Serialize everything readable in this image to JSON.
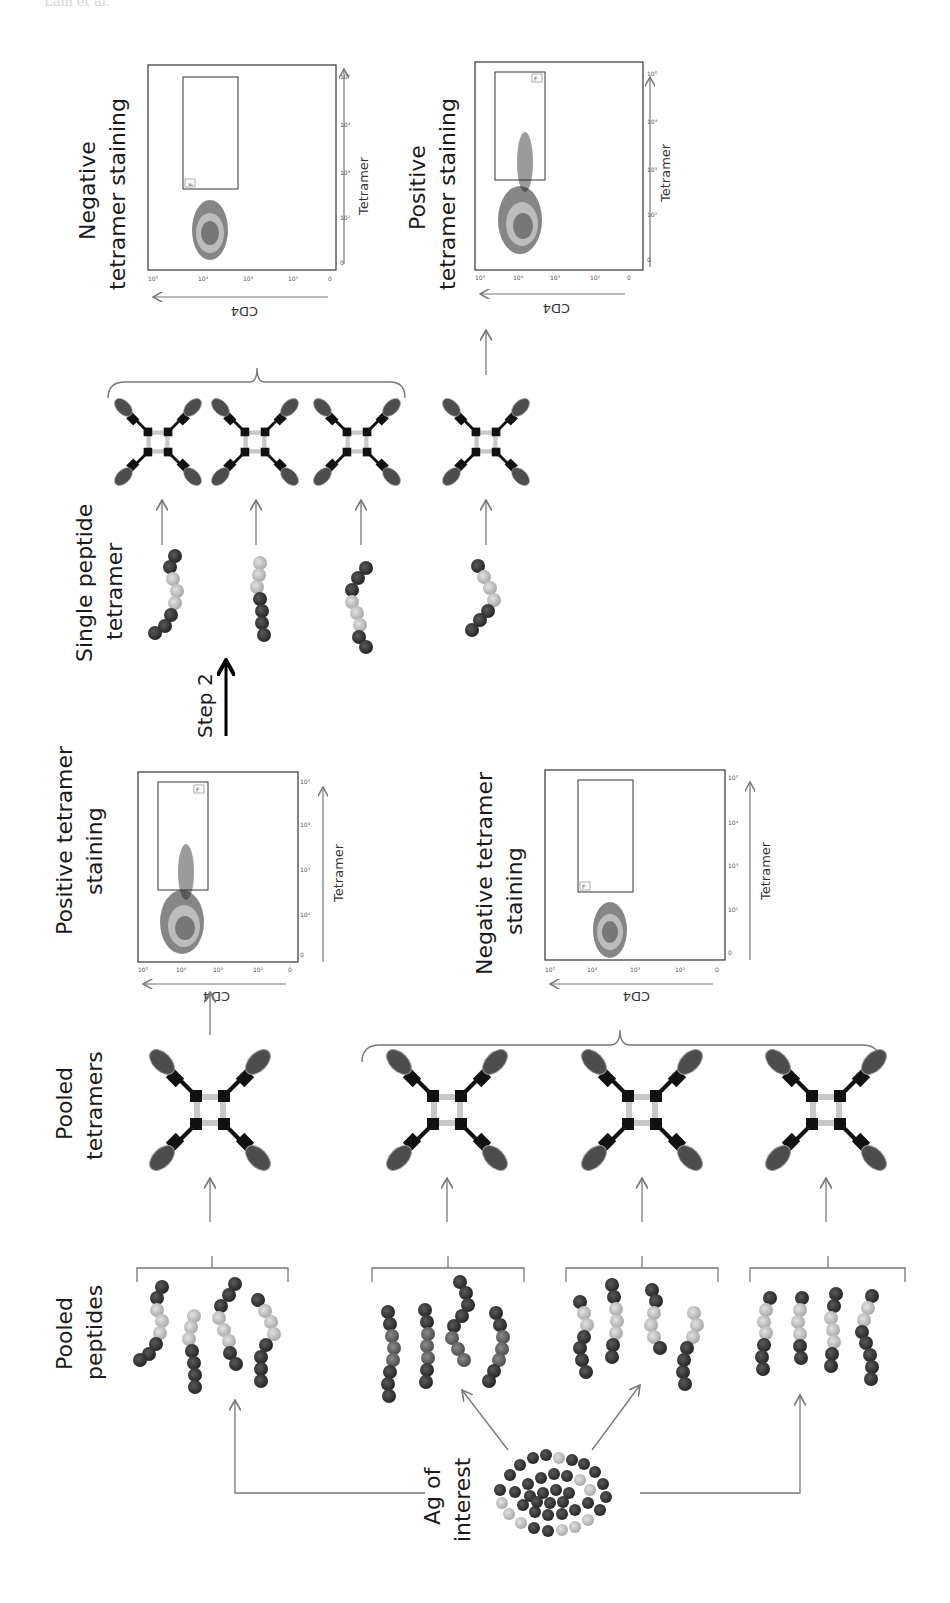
{
  "header": {
    "text": "Lam et al."
  },
  "colors": {
    "dark_residue": "#3a3a3a",
    "light_residue": "#bdbdbd",
    "mid_residue": "#6a6a6a",
    "arrow": "#777777",
    "tetramer_body": "#111111",
    "tetramer_link": "#c8c8c8",
    "mhc_ellipse": "#555555",
    "plot_core": "#7a7a7a",
    "plot_ring": "#b0b0b0"
  },
  "labels": {
    "ag_of_interest_1": "Ag of",
    "ag_of_interest_2": "interest",
    "pooled_peptides_1": "Pooled",
    "pooled_peptides_2": "peptides",
    "pooled_tetramers_1": "Pooled",
    "pooled_tetramers_2": "tetramers",
    "single_peptide_1": "Single peptide",
    "single_peptide_2": "tetramer",
    "step2": "Step 2",
    "pos_tet_low_1": "Positive tetramer",
    "pos_tet_low_2": "staining",
    "neg_tet_low_1": "Negative tetramer",
    "neg_tet_low_2": "staining",
    "neg_tet_top_1": "Negative",
    "neg_tet_top_2": "tetramer staining",
    "pos_tet_top_1": "Positive",
    "pos_tet_top_2": "tetramer staining"
  },
  "plots": {
    "x_axis_label": "Tetramer",
    "y_axis_label": "CD4",
    "x_ticks": [
      "0",
      "10²",
      "10³",
      "10⁴",
      "10⁵"
    ],
    "y_ticks": [
      "0",
      "10²",
      "10³",
      "10⁴",
      "10⁵"
    ],
    "gate_label": "F",
    "panels": [
      {
        "id": "top-negative",
        "result": "Negative tetramer staining"
      },
      {
        "id": "top-positive",
        "result": "Positive tetramer staining"
      },
      {
        "id": "low-positive",
        "result": "Positive tetramer staining"
      },
      {
        "id": "low-negative",
        "result": "Negative tetramer staining"
      }
    ]
  }
}
